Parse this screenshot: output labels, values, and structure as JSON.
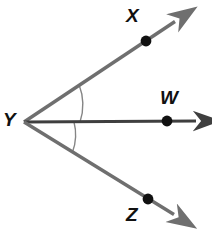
{
  "figure": {
    "background_color": "#ffffff",
    "ray_color": "#6f6f6f",
    "ray_color_dark": "#3f3f3f",
    "arc_color": "#808080",
    "point_color": "#111111",
    "label_color": "#111111",
    "vertex": {
      "name": "Y",
      "x": 24,
      "y": 122
    },
    "labels": {
      "x": "X",
      "w": "W",
      "y": "Y",
      "z": "Z"
    },
    "rays": [
      {
        "id": "ray-YX",
        "from": "Y",
        "through": "X",
        "start": {
          "x": 24,
          "y": 122
        },
        "point": {
          "x": 146,
          "y": 41
        },
        "tip": {
          "x": 180,
          "y": 18
        },
        "color": "#6f6f6f"
      },
      {
        "id": "ray-YW",
        "from": "Y",
        "through": "W",
        "start": {
          "x": 24,
          "y": 122
        },
        "point": {
          "x": 167,
          "y": 121
        },
        "tip": {
          "x": 202,
          "y": 121
        },
        "color": "#3f3f3f"
      },
      {
        "id": "ray-YZ",
        "from": "Y",
        "through": "Z",
        "start": {
          "x": 24,
          "y": 122
        },
        "point": {
          "x": 148,
          "y": 199
        },
        "tip": {
          "x": 180,
          "y": 218
        },
        "color": "#6f6f6f"
      }
    ],
    "angle_arcs": [
      {
        "id": "arc-XYW",
        "between": "X-Y-W",
        "radius": 56
      },
      {
        "id": "arc-WYZ",
        "between": "W-Y-Z",
        "radius": 50
      }
    ],
    "points": [
      {
        "label": "X",
        "x": 146,
        "y": 41,
        "r": 5
      },
      {
        "label": "W",
        "x": 167,
        "y": 121,
        "r": 5
      },
      {
        "label": "Z",
        "x": 148,
        "y": 199,
        "r": 5
      }
    ]
  }
}
